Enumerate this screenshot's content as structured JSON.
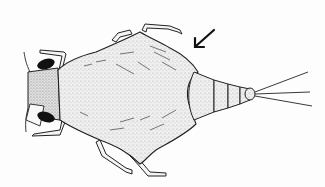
{
  "figure": {
    "subject": "Insect nymph, dorsal view (line drawing)",
    "annotation": "arrow pointing to wing pad / thoracic margin",
    "colors": {
      "background": "#fdfdfd",
      "ink": "#1a1a1a",
      "body_fill": "#eeeeee",
      "eye": "#111111"
    },
    "parts": [
      "head",
      "eyes",
      "antennae",
      "legs",
      "thorax-wingpads",
      "abdomen-segments",
      "caudal-filaments",
      "arrow"
    ]
  }
}
